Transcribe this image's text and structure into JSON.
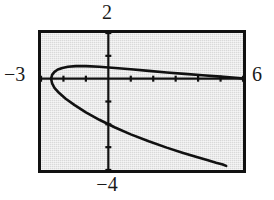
{
  "figure": {
    "kind": "graphing-calculator-plot",
    "background_color": "#d9d9d9",
    "ink_color": "#111111",
    "frame_border_color": "#111111"
  },
  "labels": {
    "top": "2",
    "bottom": "−4",
    "left": "−3",
    "right": "6"
  },
  "chart_data": {
    "type": "line",
    "title": "",
    "xlabel": "",
    "ylabel": "",
    "grid": false,
    "legend": "none",
    "xlim": [
      -3,
      6
    ],
    "ylim": [
      -4,
      2
    ],
    "xticks": [
      -3,
      -2,
      -1,
      0,
      1,
      2,
      3,
      4,
      5,
      6
    ],
    "yticks": [
      -4,
      -3,
      -2,
      -1,
      0,
      1,
      2
    ],
    "xtick_labels": [
      "-3",
      "",
      "",
      "",
      "",
      "",
      "",
      "",
      "",
      "6"
    ],
    "ytick_labels": [
      "-4",
      "",
      "",
      "",
      "",
      "",
      "2"
    ],
    "tick_marks_only": true,
    "annotations": [
      {
        "text": "2",
        "position": "top-of-y-axis",
        "value": 2
      },
      {
        "text": "-4",
        "position": "bottom-of-y-axis",
        "value": -4
      },
      {
        "text": "-3",
        "position": "left-of-x-axis",
        "value": -3
      },
      {
        "text": "6",
        "position": "right-of-x-axis",
        "value": 6
      }
    ],
    "series": [
      {
        "name": "upper-branch",
        "comment": "rightward-opening parabola, upper half",
        "x": [
          -2.55,
          -2.5,
          -2.4,
          -2.25,
          -2.05,
          -1.8,
          -1.45,
          -1.0,
          -0.4,
          0.3,
          1.0,
          1.8,
          2.6,
          3.4,
          4.2,
          5.0,
          5.8,
          6.0
        ],
        "y": [
          0.0,
          0.18,
          0.3,
          0.4,
          0.47,
          0.52,
          0.55,
          0.55,
          0.52,
          0.47,
          0.41,
          0.34,
          0.27,
          0.21,
          0.15,
          0.09,
          0.03,
          0.0
        ]
      },
      {
        "name": "lower-branch",
        "comment": "rightward-opening parabola, lower half",
        "x": [
          -2.55,
          -2.5,
          -2.4,
          -2.2,
          -1.9,
          -1.5,
          -1.0,
          -0.4,
          0.3,
          1.0,
          1.8,
          2.6,
          3.3,
          3.9,
          4.4,
          4.8,
          5.1,
          5.25
        ],
        "y": [
          0.0,
          -0.22,
          -0.4,
          -0.62,
          -0.88,
          -1.16,
          -1.48,
          -1.8,
          -2.14,
          -2.44,
          -2.74,
          -3.02,
          -3.24,
          -3.42,
          -3.56,
          -3.68,
          -3.76,
          -3.82
        ]
      }
    ]
  }
}
